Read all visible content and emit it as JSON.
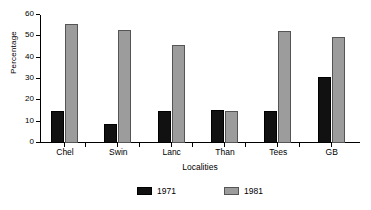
{
  "chart_data": {
    "type": "bar",
    "title": "",
    "xlabel": "Localities",
    "ylabel": "Percentage",
    "categories": [
      "Chel",
      "Swin",
      "Lanc",
      "Than",
      "Tees",
      "GB"
    ],
    "series": [
      {
        "name": "1971",
        "color": "#111111",
        "values": [
          15,
          9,
          15,
          15.5,
          15,
          31
        ]
      },
      {
        "name": "1981",
        "color": "#9c9c9c",
        "values": [
          56,
          53,
          46,
          14.8,
          52.5,
          49.5
        ]
      }
    ],
    "ylim": [
      0,
      60
    ],
    "yticks": [
      0,
      10,
      20,
      30,
      40,
      50,
      60
    ],
    "ytick_labels": [
      "0",
      "10",
      "20",
      "30",
      "40",
      "50",
      "60"
    ],
    "grid": false,
    "legend_position": "bottom"
  }
}
